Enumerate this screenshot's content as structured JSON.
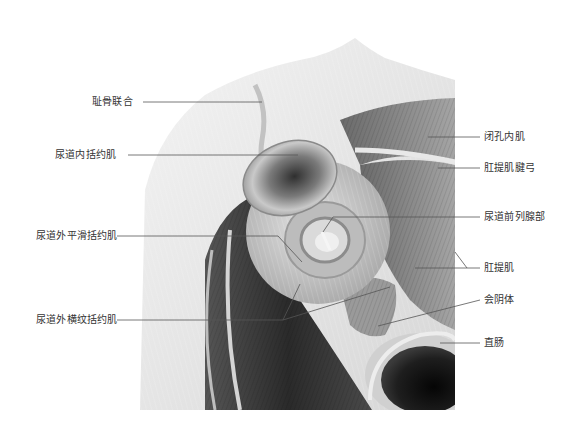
{
  "diagram": {
    "colors": {
      "background": "#ffffff",
      "label_text": "#333333",
      "leader_line": "#555555"
    }
  },
  "labels": {
    "left": [
      {
        "id": "pubic-symphysis",
        "text": "耻骨联合"
      },
      {
        "id": "internal-urethral-sphincter",
        "text": "尿道内括约肌"
      },
      {
        "id": "external-smooth-urethral-sphincter",
        "text": "尿道外平滑括约肌"
      },
      {
        "id": "external-striated-urethral-sphincter",
        "text": "尿道外横纹括约肌"
      }
    ],
    "right": [
      {
        "id": "obturator-internus",
        "text": "闭孔内肌"
      },
      {
        "id": "tendinous-arch-levator-ani",
        "text": "肛提肌腱弓"
      },
      {
        "id": "prostatic-urethra",
        "text": "尿道前列腺部"
      },
      {
        "id": "levator-ani",
        "text": "肛提肌"
      },
      {
        "id": "perineal-body",
        "text": "会阴体"
      },
      {
        "id": "rectum",
        "text": "直肠"
      }
    ]
  }
}
